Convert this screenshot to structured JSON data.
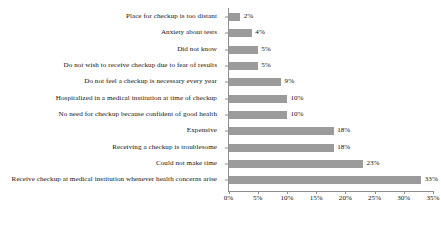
{
  "chart_data": {
    "type": "bar",
    "orientation": "horizontal",
    "title": "",
    "subtitle": "",
    "xlabel": "",
    "ylabel": "",
    "xlim": [
      0,
      35
    ],
    "grid": false,
    "legend": false,
    "value_suffix": "%",
    "axis_tick_suffix": "%",
    "bar_color": "#9b9b9b",
    "axis_color": "#8e8e8e",
    "text_color": "#141414",
    "background": "#ffffff",
    "xticks": [
      0,
      5,
      10,
      15,
      20,
      25,
      30,
      35
    ],
    "xtick_labels": [
      "0%",
      "5%",
      "10%",
      "15%",
      "20%",
      "25%",
      "30%",
      "35%"
    ],
    "categories": [
      "Place for checkup is too distant",
      "Anxiety about tests",
      "Did not know",
      "Do not wish to receive checkup due to fear of results",
      "Do not feel a checkup is necessary every year",
      "Hospitalized in a medical institution at time of checkup",
      "No need for checkup because confident of good health",
      "Expensive",
      "Receiving a checkup is troublesome",
      "Could not make time",
      "Receive checkup at medical institution whenever health concerns arise"
    ],
    "values": [
      2,
      4,
      5,
      5,
      9,
      10,
      10,
      18,
      18,
      23,
      33
    ],
    "value_labels": [
      "2%",
      "4%",
      "5%",
      "5%",
      "9%",
      "10%",
      "10%",
      "18%",
      "18%",
      "23%",
      "33%"
    ]
  }
}
